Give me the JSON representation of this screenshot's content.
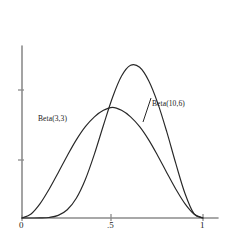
{
  "figure": {
    "background_color": "#ffffff",
    "axis_color": "#8c8c8c",
    "curve_color": "#272727",
    "text_color": "#1b1b1b"
  },
  "axes": {
    "x_tick_labels": [
      "0",
      ".5",
      "1"
    ],
    "y_tick_labels": []
  },
  "labels": {
    "beta_3_3": "Beta(3,3)",
    "beta_10_6": "Beta(10,6)"
  },
  "chart_data": {
    "type": "line",
    "title": "",
    "subtitle": "",
    "xlabel": "",
    "ylabel": "",
    "xlim": [
      0,
      1
    ],
    "ylim": [
      0,
      3.6
    ],
    "grid": false,
    "legend": "inline-annotations",
    "x_ticks": [
      0,
      0.5,
      1
    ],
    "x_tick_labels": [
      "0",
      ".5",
      "1"
    ],
    "y_ticks": [
      1.2,
      2.4
    ],
    "y_tick_labels": [
      "",
      ""
    ],
    "annotations": [
      {
        "text": "Beta(3,3)",
        "x": 0.2,
        "y": 1.45
      },
      {
        "text": "Beta(10,6)",
        "x": 0.72,
        "y": 1.72
      }
    ],
    "series": [
      {
        "name": "Beta(3,3)",
        "distribution": "beta",
        "alpha": 3,
        "beta": 3,
        "mode": 0.5,
        "peak_value": 1.875,
        "x": [
          0.0,
          0.05,
          0.1,
          0.15,
          0.2,
          0.25,
          0.3,
          0.35,
          0.4,
          0.45,
          0.5,
          0.55,
          0.6,
          0.65,
          0.7,
          0.75,
          0.8,
          0.85,
          0.9,
          0.95,
          1.0
        ],
        "values": [
          0.0,
          0.068,
          0.243,
          0.488,
          0.768,
          1.055,
          1.323,
          1.547,
          1.714,
          1.824,
          1.875,
          1.824,
          1.714,
          1.547,
          1.323,
          1.055,
          0.768,
          0.488,
          0.243,
          0.068,
          0.0
        ]
      },
      {
        "name": "Beta(10,6)",
        "distribution": "beta",
        "alpha": 10,
        "beta": 6,
        "mode": 0.642857,
        "peak_value": 3.405,
        "x": [
          0.0,
          0.05,
          0.1,
          0.15,
          0.2,
          0.25,
          0.3,
          0.35,
          0.4,
          0.45,
          0.5,
          0.55,
          0.6,
          0.65,
          0.7,
          0.75,
          0.8,
          0.85,
          0.9,
          0.95,
          1.0
        ],
        "values": [
          0.0,
          0.0,
          0.001,
          0.009,
          0.044,
          0.139,
          0.334,
          0.652,
          1.082,
          1.571,
          2.042,
          2.405,
          2.587,
          2.554,
          2.326,
          1.946,
          1.458,
          0.92,
          0.419,
          0.073,
          0.0
        ]
      }
    ]
  }
}
